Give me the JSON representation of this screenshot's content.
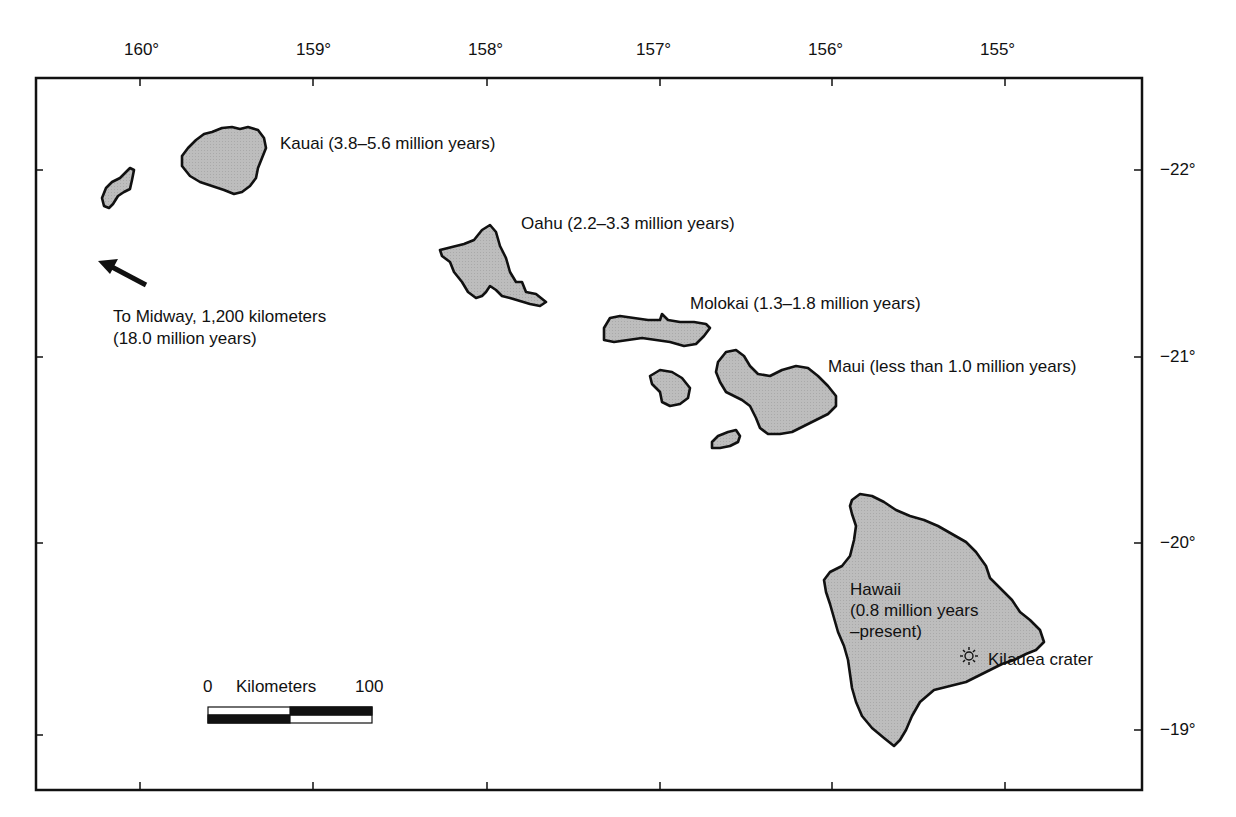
{
  "map": {
    "title": "",
    "longitude_labels": [
      "160°",
      "159°",
      "158°",
      "157°",
      "156°",
      "155°"
    ],
    "latitude_labels": [
      "−22°",
      "−21°",
      "−20°",
      "−19°"
    ],
    "colors": {
      "land": "#b9b9b9",
      "outline": "#111111",
      "background": "#ffffff"
    },
    "islands": [
      {
        "name": "Niihau",
        "label": ""
      },
      {
        "name": "Kauai",
        "label": "Kauai (3.8–5.6 million years)"
      },
      {
        "name": "Oahu",
        "label": "Oahu (2.2–3.3 million years)"
      },
      {
        "name": "Molokai",
        "label": "Molokai (1.3–1.8 million years)"
      },
      {
        "name": "Lanai",
        "label": ""
      },
      {
        "name": "Maui",
        "label": "Maui (less than 1.0 million years)"
      },
      {
        "name": "Kahoolawe",
        "label": ""
      },
      {
        "name": "Hawaii",
        "label_lines": [
          "Hawaii",
          "(0.8 million years",
          "–present)"
        ]
      }
    ],
    "midway": {
      "line1": "To Midway, 1,200 kilometers",
      "line2": "(18.0 million years)"
    },
    "kilauea": {
      "label": "Kilauea crater",
      "icon": "volcano-sun-icon"
    },
    "scale_bar": {
      "start": "0",
      "unit": "Kilometers",
      "end": "100"
    }
  }
}
